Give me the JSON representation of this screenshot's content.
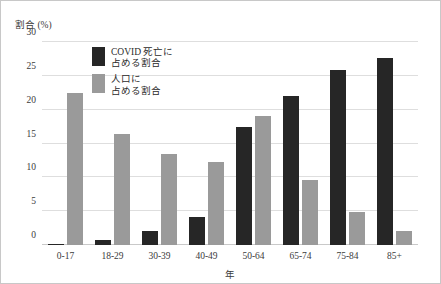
{
  "chart_data": {
    "type": "bar",
    "title": "",
    "subtitle": "",
    "ylabel": "割合 (%)",
    "xlabel": "年",
    "categories": [
      "0-17",
      "18-29",
      "30-39",
      "40-49",
      "50-64",
      "65-74",
      "75-84",
      "85+"
    ],
    "series": [
      {
        "name": "COVID 死亡に\n占める割合",
        "color": "#262626",
        "values": [
          0.2,
          0.8,
          2.0,
          4.2,
          17.4,
          22.0,
          25.9,
          27.6
        ]
      },
      {
        "name": "人口に\n占める割合",
        "color": "#9a9a9a",
        "values": [
          22.5,
          16.4,
          13.4,
          12.2,
          19.1,
          9.6,
          4.9,
          2.1
        ]
      }
    ],
    "ylim": [
      0,
      30
    ],
    "yticks": [
      0,
      5,
      10,
      15,
      20,
      25,
      30
    ],
    "grid": true,
    "legend_position": "upper-left-inside"
  }
}
